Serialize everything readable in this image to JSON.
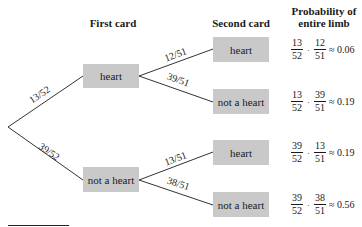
{
  "headers": {
    "first_card": "First card",
    "second_card": "Second card",
    "probability_line1": "Probability of",
    "probability_line2": "entire limb"
  },
  "first_level": [
    {
      "label": "heart",
      "branch_prob": "13/52"
    },
    {
      "label": "not a heart",
      "branch_prob": "39/52"
    }
  ],
  "second_level": [
    {
      "label": "heart",
      "branch_prob": "12/51"
    },
    {
      "label": "not a heart",
      "branch_prob": "39/51"
    },
    {
      "label": "heart",
      "branch_prob": "13/51"
    },
    {
      "label": "not a heart",
      "branch_prob": "38/51"
    }
  ],
  "limb_probabilities": [
    {
      "n1": "13",
      "d1": "52",
      "op": "·",
      "n2": "12",
      "d2": "51",
      "approx": "≈ 0.06"
    },
    {
      "n1": "13",
      "d1": "52",
      "op": "·",
      "n2": "39",
      "d2": "51",
      "approx": "≈ 0.19"
    },
    {
      "n1": "39",
      "d1": "52",
      "op": "·",
      "n2": "13",
      "d2": "51",
      "approx": "≈ 0.19"
    },
    {
      "n1": "39",
      "d1": "52",
      "op": "·",
      "n2": "38",
      "d2": "51",
      "approx": "≈ 0.56"
    }
  ],
  "colors": {
    "box_fill": "#c9c9c9",
    "line": "#333333",
    "text": "#1a1a1a"
  }
}
